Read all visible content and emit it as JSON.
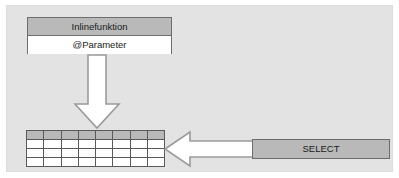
{
  "diagram": {
    "panel": {
      "background_color": "#e3e3e3"
    },
    "inline_function_box": {
      "header_label": "Inlinefunktion",
      "parameter_label": "@Parameter",
      "header_fill": "#b9b9b9",
      "body_fill": "#ffffff",
      "border_color": "#6d6d6d"
    },
    "arrows": [
      {
        "name": "down-arrow",
        "direction": "down",
        "fill": "#ffffff",
        "stroke": "#9a9a9a"
      },
      {
        "name": "left-arrow",
        "direction": "left",
        "fill": "#ffffff",
        "stroke": "#9a9a9a"
      }
    ],
    "result_table": {
      "columns": 8,
      "rows": 4,
      "header_row_fill": "#b9b9b9",
      "body_fill": "#ffffff",
      "grid_color": "#5a5a5a",
      "cells": [
        [
          "",
          "",
          "",
          "",
          "",
          "",
          "",
          ""
        ],
        [
          "",
          "",
          "",
          "",
          "",
          "",
          "",
          ""
        ],
        [
          "",
          "",
          "",
          "",
          "",
          "",
          "",
          ""
        ],
        [
          "",
          "",
          "",
          "",
          "",
          "",
          "",
          ""
        ]
      ]
    },
    "select_box": {
      "label": "SELECT",
      "fill": "#b9b9b9",
      "border_color": "#6d6d6d"
    }
  }
}
